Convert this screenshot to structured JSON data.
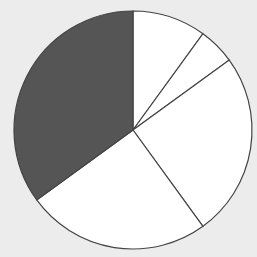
{
  "chart_data": {
    "type": "pie",
    "title": "",
    "categories": [
      "Slice A",
      "Slice B",
      "Slice C",
      "Slice D",
      "Slice E"
    ],
    "values": [
      10,
      5,
      25,
      25,
      35
    ],
    "colors": [
      "#ffffff",
      "#ffffff",
      "#ffffff",
      "#ffffff",
      "#555555"
    ],
    "start_angle_deg": 0,
    "direction": "clockwise",
    "legend": null,
    "labels_shown": false
  },
  "style": {
    "background": "#ececec",
    "stroke": "#444444"
  }
}
